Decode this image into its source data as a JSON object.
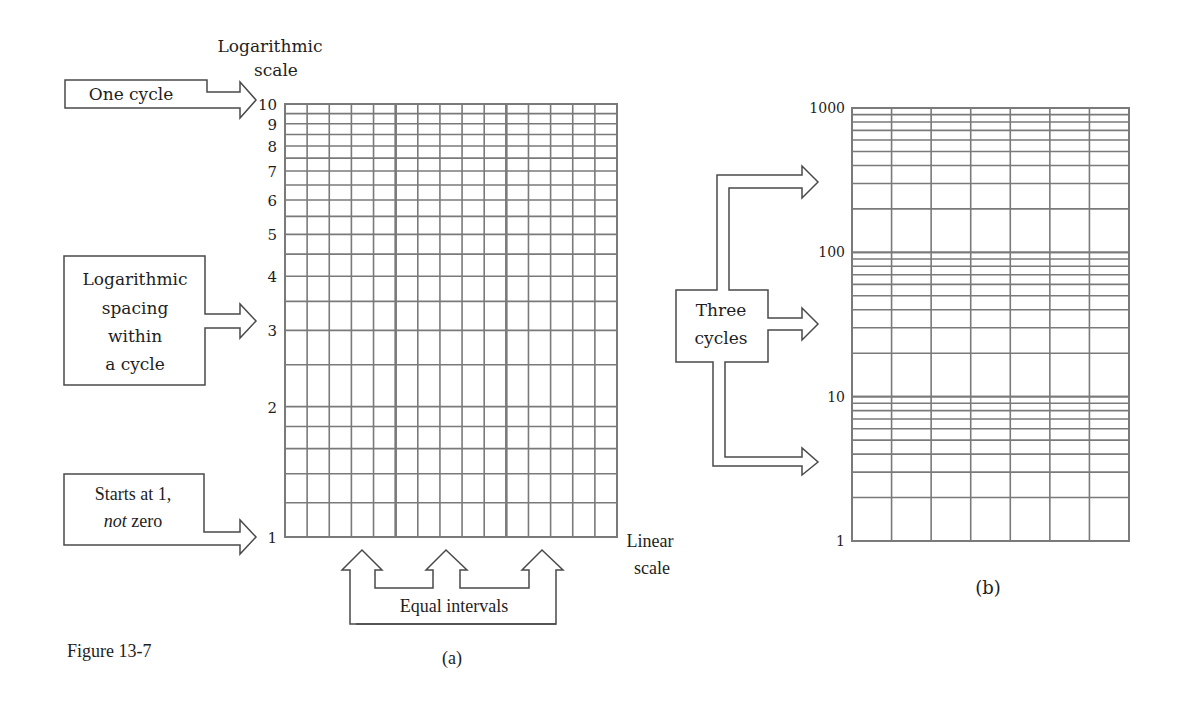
{
  "figure": {
    "label": "Figure 13-7",
    "panel_a_caption": "(a)",
    "panel_b_caption": "(b)"
  },
  "panel_a": {
    "y_axis_title_line1": "Logarithmic",
    "y_axis_title_line2": "scale",
    "x_axis_title_line1": "Linear",
    "x_axis_title_line2": "scale",
    "tick_labels": [
      "1",
      "2",
      "3",
      "4",
      "5",
      "6",
      "7",
      "8",
      "9",
      "10"
    ],
    "callouts": {
      "one_cycle": "One cycle",
      "log_spacing": [
        "Logarithmic",
        "spacing",
        "within",
        "a cycle"
      ],
      "starts_at_1_line1": "Starts at 1,",
      "starts_at_1_not": "not",
      "starts_at_1_zero": " zero",
      "equal_intervals": "Equal intervals"
    }
  },
  "panel_b": {
    "tick_labels": [
      "1",
      "10",
      "100",
      "1000"
    ],
    "callouts": {
      "three_cycles_line1": "Three",
      "three_cycles_line2": "cycles"
    }
  },
  "colors": {
    "grid": "#7a7a7a",
    "outline": "#4a4a4a",
    "text": "#1e1e1e",
    "background": "#ffffff"
  },
  "chart_data": [
    {
      "type": "table",
      "title": "(a) Semi-log graph paper, one cycle",
      "xlabel": "Linear scale",
      "ylabel": "Logarithmic scale",
      "y_scale": "log",
      "ylim": [
        1,
        10
      ],
      "y_ticks": [
        1,
        2,
        3,
        4,
        5,
        6,
        7,
        8,
        9,
        10
      ],
      "y_minor_gridlines": [
        1.2,
        1.4,
        1.6,
        1.8,
        2.5,
        3.5,
        4.5,
        5.5,
        6.5,
        7.5,
        8.5,
        9.5
      ],
      "x_divisions": 15,
      "grid": true,
      "annotations": [
        "One cycle",
        "Logarithmic spacing within a cycle",
        "Starts at 1, not zero",
        "Equal intervals"
      ]
    },
    {
      "type": "table",
      "title": "(b) Semi-log graph paper, three cycles",
      "y_scale": "log",
      "ylim": [
        1,
        1000
      ],
      "y_ticks": [
        1,
        10,
        100,
        1000
      ],
      "cycles": 3,
      "x_divisions": 7,
      "grid": true,
      "annotations": [
        "Three cycles"
      ]
    }
  ]
}
